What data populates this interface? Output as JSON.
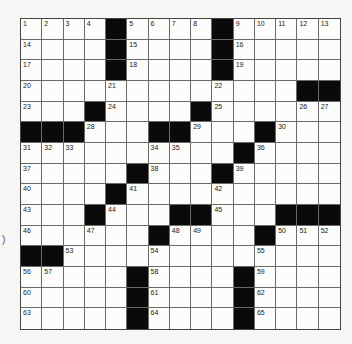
{
  "puzzle": {
    "rows": 15,
    "cols": 15,
    "grid": [
      [
        "1",
        "2",
        "3",
        "4",
        "#",
        "5",
        "6",
        "7",
        "8",
        "#",
        "9",
        "10",
        "11",
        "12",
        "13"
      ],
      [
        "14",
        "",
        "",
        "",
        "#",
        "15",
        "",
        "",
        "",
        "#",
        "16",
        "",
        "",
        "",
        ""
      ],
      [
        "17",
        "",
        "",
        "",
        "#",
        "18",
        "",
        "",
        "",
        "#",
        "19",
        "",
        "",
        "",
        ""
      ],
      [
        "20",
        "",
        "",
        "",
        "21",
        "",
        "",
        "",
        "",
        "22",
        "",
        "",
        "",
        "#",
        "#"
      ],
      [
        "23",
        "",
        "",
        "#",
        "24",
        "",
        "",
        "",
        "#",
        "25",
        "",
        "",
        "",
        "26",
        "27"
      ],
      [
        "#",
        "#",
        "#",
        "28",
        "",
        "",
        "#",
        "#",
        "29",
        "",
        "",
        "#",
        "30",
        "",
        ""
      ],
      [
        "31",
        "32",
        "33",
        "",
        "",
        "",
        "34",
        "35",
        "",
        "",
        "#",
        "36",
        "",
        "",
        ""
      ],
      [
        "37",
        "",
        "",
        "",
        "",
        "#",
        "38",
        "",
        "",
        "#",
        "39",
        "",
        "",
        "",
        ""
      ],
      [
        "40",
        "",
        "",
        "",
        "#",
        "41",
        "",
        "",
        "",
        "42",
        "",
        "",
        "",
        "",
        ""
      ],
      [
        "43",
        "",
        "",
        "#",
        "44",
        "",
        "",
        "#",
        "#",
        "45",
        "",
        "",
        "#",
        "#",
        "#"
      ],
      [
        "46",
        "",
        "",
        "47",
        "",
        "",
        "#",
        "48",
        "49",
        "",
        "",
        "#",
        "50",
        "51",
        "52"
      ],
      [
        "#",
        "#",
        "53",
        "",
        "",
        "",
        "54",
        "",
        "",
        "",
        "",
        "55",
        "",
        "",
        ""
      ],
      [
        "56",
        "57",
        "",
        "",
        "",
        "#",
        "58",
        "",
        "",
        "",
        "#",
        "59",
        "",
        "",
        ""
      ],
      [
        "60",
        "",
        "",
        "",
        "",
        "#",
        "61",
        "",
        "",
        "",
        "#",
        "62",
        "",
        "",
        ""
      ],
      [
        "63",
        "",
        "",
        "",
        "",
        "#",
        "64",
        "",
        "",
        "",
        "#",
        "65",
        "",
        "",
        ""
      ]
    ]
  },
  "stray_mark": ")"
}
